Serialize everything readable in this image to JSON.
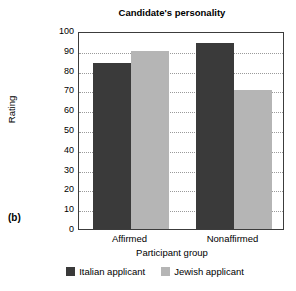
{
  "panel_label": "(b)",
  "chart_data": {
    "type": "bar",
    "title": "Candidate's personality",
    "xlabel": "Participant group",
    "ylabel": "Rating",
    "ylim": [
      0,
      100
    ],
    "ytick_step": 10,
    "yticks": [
      "0",
      "10",
      "20",
      "30",
      "40",
      "50",
      "60",
      "70",
      "80",
      "90",
      "100"
    ],
    "grid": "horizontal-dotted",
    "legend_position": "bottom-center",
    "categories": [
      "Affirmed",
      "Nonaffirmed"
    ],
    "series": [
      {
        "name": "Italian applicant",
        "color": "#3a3a3a",
        "values": [
          84,
          94
        ]
      },
      {
        "name": "Jewish applicant",
        "color": "#b5b5b5",
        "values": [
          90,
          70
        ]
      }
    ]
  }
}
